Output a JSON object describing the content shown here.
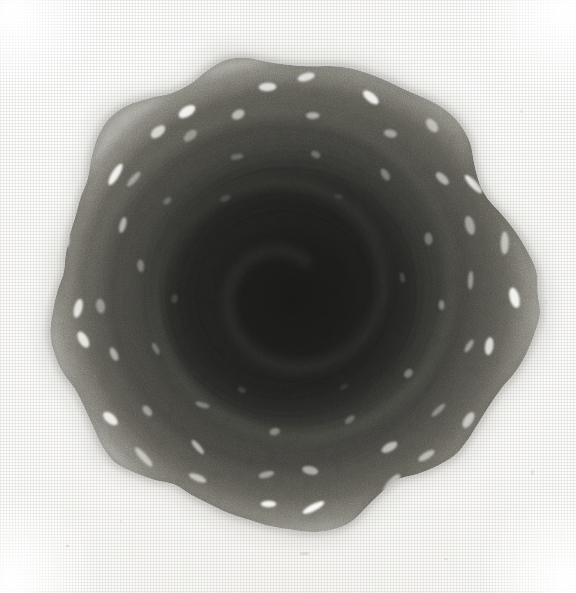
{
  "artwork": {
    "title": "Dark circular textured form",
    "medium_surface": "woven canvas / linen weave",
    "tonality": "monochrome greyscale",
    "caption": "",
    "alt_text": "A dark, heavily textured circular mass rendered in graphite on woven canvas, ringed by small bright white elongated dashes and showing faint concentric spiral banding toward its centre."
  },
  "canvas": {
    "width": 576,
    "height": 593,
    "background_color": "#fdfdfc",
    "weave_color": "#96948e",
    "weave_pitch_px": 3,
    "corner_highlight_color": "#ffffff"
  },
  "subject": {
    "name": "dark-circular-form",
    "shape": "irregular-disc",
    "center": {
      "x": 288,
      "y": 292
    },
    "radius_x": 236,
    "radius_y": 231,
    "bounds": {
      "left": 48,
      "top": 62,
      "right": 521,
      "bottom": 521
    },
    "edge_note": "lobed, slightly polygonal rim with a small pointed notch at the top and a bump protruding on the right",
    "colors": {
      "core": "#1d1d1c",
      "mid": "#3a3a38",
      "outer_ring": "#5d5c57",
      "rim_halo": "#8e8c85",
      "edge_fade": "#b6b4ad",
      "highlight_dash": "#fbfbf8"
    }
  },
  "rings": [
    {
      "name": "core",
      "radius": 96,
      "tone": "#1d1d1c",
      "opacity": 1.0
    },
    {
      "name": "inner-band",
      "radius": 136,
      "tone": "#262625",
      "opacity": 0.95
    },
    {
      "name": "mid-band",
      "radius": 172,
      "tone": "#333331",
      "opacity": 0.9
    },
    {
      "name": "outer-band",
      "radius": 202,
      "tone": "#46453f",
      "opacity": 0.85
    },
    {
      "name": "rim-band",
      "radius": 228,
      "tone": "#6b6a63",
      "opacity": 0.7
    }
  ],
  "spiral": {
    "visible": true,
    "turns": 2.4,
    "direction": "counter-clockwise",
    "stroke_color": "#6e6d66",
    "stroke_opacity": 0.22
  },
  "highlight_dashes": {
    "count": 58,
    "description": "small bright elongated oval dashes arranged in concentric rings, brightest and largest near the rim, tangentially oriented",
    "rings": [
      {
        "radius": 218,
        "count": 22,
        "length": 19,
        "width": 8,
        "brightness": 0.95
      },
      {
        "radius": 186,
        "count": 18,
        "length": 15,
        "width": 7,
        "brightness": 0.62
      },
      {
        "radius": 150,
        "count": 12,
        "length": 12,
        "width": 6,
        "brightness": 0.38
      },
      {
        "radius": 110,
        "count": 6,
        "length": 10,
        "width": 5,
        "brightness": 0.24
      }
    ]
  },
  "specks": [
    {
      "x": 66,
      "y": 545,
      "w": 3,
      "h": 2,
      "opacity": 0.45
    },
    {
      "x": 300,
      "y": 552,
      "w": 9,
      "h": 3,
      "opacity": 0.35
    },
    {
      "x": 444,
      "y": 558,
      "w": 4,
      "h": 2,
      "opacity": 0.28
    },
    {
      "x": 531,
      "y": 470,
      "w": 3,
      "h": 5,
      "opacity": 0.25
    },
    {
      "x": 545,
      "y": 300,
      "w": 2,
      "h": 4,
      "opacity": 0.22
    },
    {
      "x": 520,
      "y": 110,
      "w": 3,
      "h": 3,
      "opacity": 0.24
    },
    {
      "x": 120,
      "y": 520,
      "w": 2,
      "h": 2,
      "opacity": 0.22
    }
  ]
}
